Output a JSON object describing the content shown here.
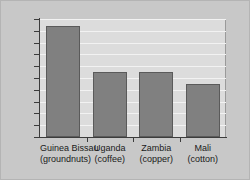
{
  "chart_data": {
    "type": "bar",
    "title": "",
    "xlabel": "",
    "ylabel": "",
    "categories": [
      "Guinea Bissau",
      "Uganda",
      "Zambia",
      "Mali"
    ],
    "category_sublabels": [
      "(groundnuts)",
      "(coffee)",
      "(copper)",
      "(cotton)"
    ],
    "values": [
      94,
      55,
      55,
      45
    ],
    "ylim": [
      0,
      100
    ],
    "ytick_labels": [
      "0",
      "10",
      "20",
      "30",
      "40",
      "50",
      "60",
      "70",
      "80",
      "90",
      "100"
    ],
    "ytick_values": [
      0,
      10,
      20,
      30,
      40,
      50,
      60,
      70,
      80,
      90,
      100
    ],
    "grid": true,
    "legend": "none",
    "colors": {
      "bar_fill": "#808080",
      "bar_border": "#5a5a5a",
      "plot_background": "#dcdcdc",
      "figure_background": "#c8c8c8",
      "gridline": "#f2f2f2",
      "axis": "#3c3c3c",
      "text": "#1a1a1a"
    }
  }
}
